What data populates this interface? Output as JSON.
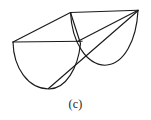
{
  "figure": {
    "caption": "(c)",
    "stroke_color": "#1a1a1a",
    "background_color": "#ffffff",
    "width": 151,
    "height": 120,
    "vertices": {
      "left_rim": [
        13,
        42
      ],
      "top_left_peak": [
        70,
        12
      ],
      "top_right_peak": [
        138,
        10
      ],
      "center_junction": [
        80,
        42
      ],
      "left_arc_bottom": [
        50,
        89
      ],
      "right_arc_bottom": [
        106,
        65
      ]
    },
    "edges": [
      {
        "name": "top-edge",
        "from": "top_left_peak",
        "to": "top_right_peak",
        "kind": "line"
      },
      {
        "name": "left-upper-edge",
        "from": "left_rim",
        "to": "top_left_peak",
        "kind": "line"
      },
      {
        "name": "mid-horizontal-edge",
        "from": "left_rim",
        "to": "center_junction",
        "kind": "line"
      },
      {
        "name": "front-left-diagonal",
        "from": "top_left_peak",
        "to": "center_junction",
        "kind": "line"
      },
      {
        "name": "center-to-right-diagonal",
        "from": "center_junction",
        "to": "top_right_peak",
        "kind": "line"
      },
      {
        "name": "bottom-slant-edge",
        "from": "left_arc_bottom",
        "to": "top_right_peak",
        "kind": "line"
      },
      {
        "name": "left-semicircular-arc",
        "from": "left_rim",
        "to": "center_junction",
        "kind": "arc"
      },
      {
        "name": "right-semicircular-arc",
        "from": "top_left_peak",
        "to": "top_right_peak",
        "kind": "arc"
      }
    ]
  }
}
